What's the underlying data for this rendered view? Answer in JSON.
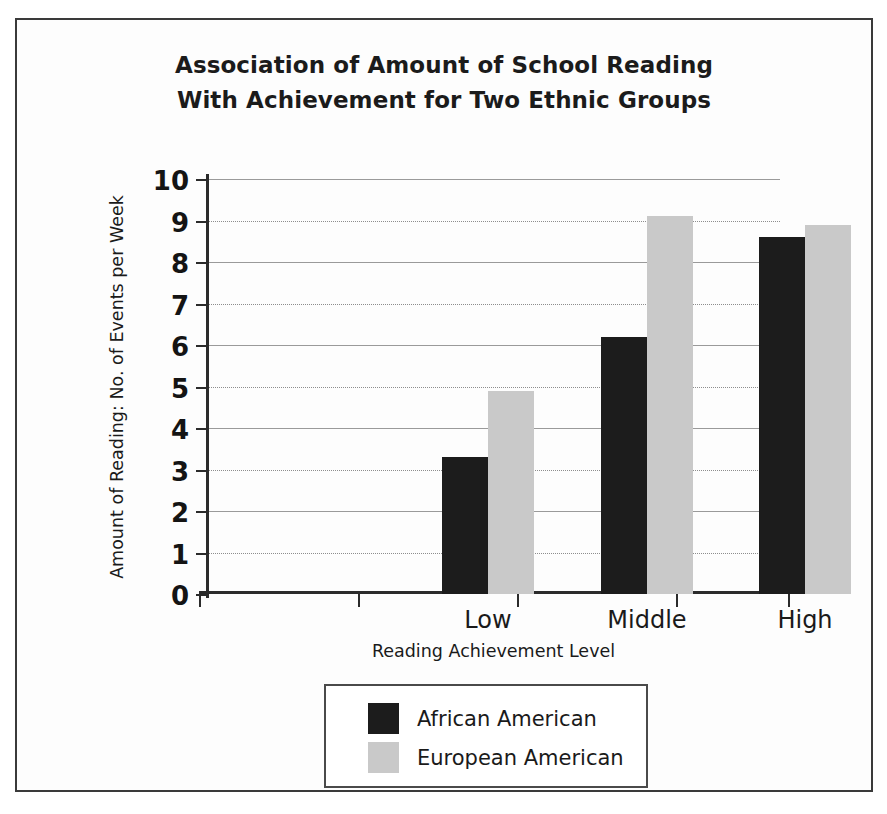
{
  "chart_data": {
    "type": "bar",
    "title": "Association of Amount of School Reading With Achievement for Two Ethnic Groups",
    "title_lines": [
      "Association of Amount of School Reading",
      "With Achievement for Two Ethnic Groups"
    ],
    "categories": [
      "Low",
      "Middle",
      "High"
    ],
    "series": [
      {
        "name": "African American",
        "values": [
          3.3,
          6.2,
          8.6
        ],
        "color": "#1c1c1c"
      },
      {
        "name": "European American",
        "values": [
          4.9,
          9.1,
          8.9
        ],
        "color": "#c9c9c9"
      }
    ],
    "xlabel": "Reading Achievement Level",
    "ylabel": "Amount of Reading: No. of Events per Week",
    "ylim": [
      0,
      10
    ],
    "ytick_labels": [
      "0",
      "1",
      "2",
      "3",
      "4",
      "5",
      "6",
      "7",
      "8",
      "9",
      "10"
    ],
    "ytick_values": [
      0,
      1,
      2,
      3,
      4,
      5,
      6,
      7,
      8,
      9,
      10
    ],
    "grid": "horizontal-dotted",
    "legend_position": "below-plot-centered",
    "legend_entries": [
      "African American",
      "European American"
    ],
    "frame": "outer-rectangle-border"
  }
}
